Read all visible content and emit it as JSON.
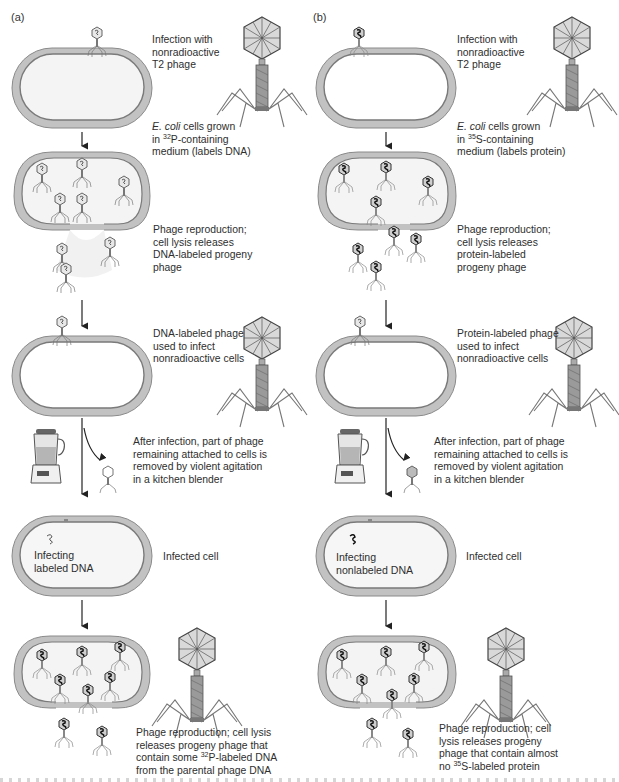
{
  "figure": {
    "colors": {
      "cell_wall": "#b8b8b8",
      "cell_wall_dark": "#8a8a8a",
      "cell_interior": "#f3f3f3",
      "phage_line": "#555555",
      "text": "#2e2e2e"
    }
  },
  "panels": [
    {
      "id": "a",
      "label": "(a)",
      "steps": [
        {
          "name": "infection",
          "text": "Infection with\nnonradioactive\nT2 phage"
        },
        {
          "name": "growth",
          "text_prefix_italic": "E. coli",
          "text_line1_rest": " cells grown",
          "text_line2_pre": "in ",
          "isotope_sup": "32",
          "isotope_rest": "P-containing",
          "text_line3": "medium (labels DNA)"
        },
        {
          "name": "reproduction",
          "text": "Phage reproduction;\ncell lysis releases\nDNA-labeled progeny\nphage"
        },
        {
          "name": "labeled-infect",
          "text": "DNA-labeled phage\nused to infect\nnonradioactive cells"
        },
        {
          "name": "blender",
          "text": "After infection, part of phage\nremaining attached to cells is\nremoved by violent agitation\nin a kitchen blender"
        },
        {
          "name": "infected-cell",
          "text": "Infected cell",
          "inner_label": "Infecting\nlabeled DNA"
        },
        {
          "name": "progeny",
          "text_line1": "Phage reproduction; cell lysis",
          "text_line2": "releases progeny phage that",
          "text_line3_pre": "contain some ",
          "isotope_sup": "32",
          "isotope_rest": "P-labeled DNA",
          "text_line4": "from the parental phage DNA"
        }
      ]
    },
    {
      "id": "b",
      "label": "(b)",
      "steps": [
        {
          "name": "infection",
          "text": "Infection with\nnonradioactive\nT2 phage"
        },
        {
          "name": "growth",
          "text_prefix_italic": "E. coli",
          "text_line1_rest": " cells grown",
          "text_line2_pre": "in ",
          "isotope_sup": "35",
          "isotope_rest": "S-containing",
          "text_line3": "medium (labels protein)"
        },
        {
          "name": "reproduction",
          "text": "Phage reproduction;\ncell lysis releases\nprotein-labeled\nprogeny phage"
        },
        {
          "name": "labeled-infect",
          "text": "Protein-labeled phage\nused to infect\nnonradioactive cells"
        },
        {
          "name": "blender",
          "text": "After infection, part of phage\nremaining attached to cells is\nremoved by violent agitation\nin a kitchen blender"
        },
        {
          "name": "infected-cell",
          "text": "Infected cell",
          "inner_label": "Infecting\nnonlabeled DNA"
        },
        {
          "name": "progeny",
          "text_line1": "Phage reproduction; cell",
          "text_line2": "lysis releases progeny",
          "text_line3": "phage that contain almost",
          "text_line4_pre": "no ",
          "isotope_sup": "35",
          "isotope_rest": "S-labeled protein"
        }
      ]
    }
  ]
}
